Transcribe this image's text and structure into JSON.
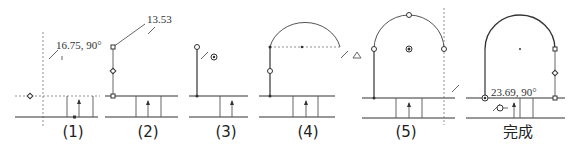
{
  "steps": [
    {
      "label": "(1)",
      "annotation": "16.75, 90°"
    },
    {
      "label": "(2)",
      "annotation": "13.53"
    },
    {
      "label": "(3)",
      "annotation": ""
    },
    {
      "label": "(4)",
      "annotation": ""
    },
    {
      "label": "(5)",
      "annotation": ""
    },
    {
      "label": "完成",
      "annotation": "23.69, 90°"
    }
  ],
  "colors": {
    "line": "#333333",
    "dashed": "#777777",
    "background": "#ffffff"
  }
}
